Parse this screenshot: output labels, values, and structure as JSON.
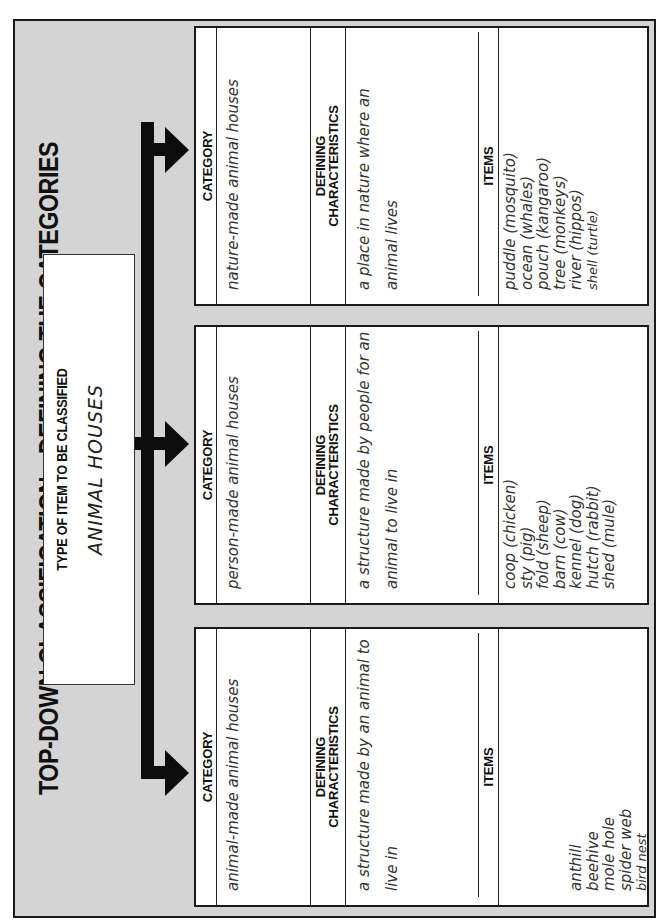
{
  "title": "TOP-DOWN CLASSIFICATION—DEFINING THE CATEGORIES",
  "type_box": {
    "label": "TYPE OF ITEM TO BE CLASSIFIED",
    "value": "ANIMAL HOUSES"
  },
  "headers": {
    "category": "CATEGORY",
    "defining_line1": "DEFINING",
    "defining_line2": "CHARACTERISTICS",
    "items": "ITEMS"
  },
  "categories": [
    {
      "category": "animal-made animal houses",
      "defining": "a structure made by an animal to live in",
      "items": [
        "anthill",
        "beehive",
        "mole hole",
        "spider web",
        "bird nest"
      ]
    },
    {
      "category": "person-made animal houses",
      "defining": "a structure made by people for an animal to live in",
      "items": [
        "coop (chicken)",
        "sty (pig)",
        "fold (sheep)",
        "barn (cow)",
        "kennel (dog)",
        "hutch (rabbit)",
        "shed (mule)"
      ]
    },
    {
      "category": "nature-made animal houses",
      "defining": "a place in nature where an animal lives",
      "items": [
        "puddle (mosquito)",
        "ocean (whales)",
        "pouch (kangaroo)",
        "tree (monkeys)",
        "river (hippos)",
        "shell (turtle)"
      ]
    }
  ],
  "colors": {
    "background_panel": "#d4d4d4",
    "arrow": "#0c0c0c",
    "box": "#ffffff",
    "border": "#1a1a1a"
  }
}
